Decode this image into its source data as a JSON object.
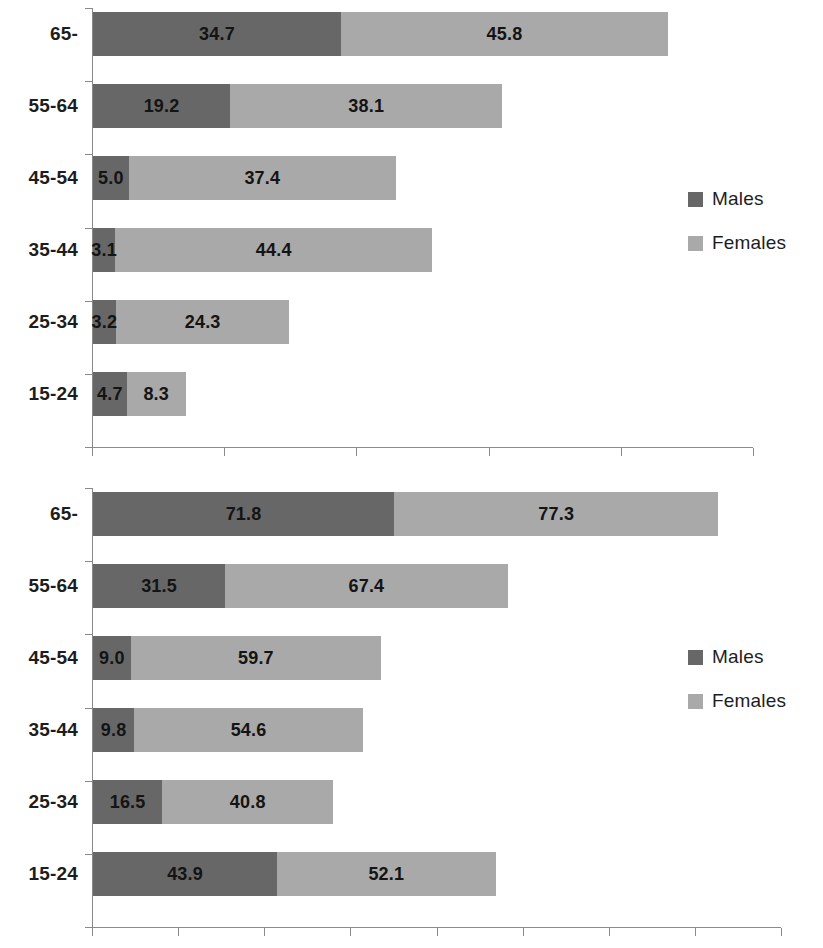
{
  "chart_data": [
    {
      "id": "top",
      "type": "bar",
      "orientation": "horizontal",
      "stacked": true,
      "title": "",
      "subtitle": "",
      "xlabel": "",
      "ylabel": "",
      "grid": false,
      "legend_position": "right-middle",
      "categories": [
        "65-",
        "55-64",
        "45-54",
        "35-44",
        "25-34",
        "15-24"
      ],
      "series": [
        {
          "name": "Males",
          "color": "#676767",
          "values": [
            34.7,
            19.2,
            5.0,
            3.1,
            3.2,
            4.7
          ]
        },
        {
          "name": "Females",
          "color": "#a9a9a9",
          "values": [
            45.8,
            38.1,
            37.4,
            44.4,
            24.3,
            8.3
          ]
        }
      ],
      "value_labels": [
        [
          "34.7",
          "45.8"
        ],
        [
          "19.2",
          "38.1"
        ],
        [
          "5.0",
          "37.4"
        ],
        [
          "3.1",
          "44.4"
        ],
        [
          "3.2",
          "24.3"
        ],
        [
          "4.7",
          "8.3"
        ]
      ],
      "xlim": [
        0,
        90
      ],
      "x_tick_count": 6,
      "x_tick_labels": [
        "",
        "",
        "",
        "",
        "",
        ""
      ],
      "legend": [
        "Males",
        "Females"
      ]
    },
    {
      "id": "bottom",
      "type": "bar",
      "orientation": "horizontal",
      "stacked": true,
      "title": "",
      "subtitle": "",
      "xlabel": "",
      "ylabel": "",
      "grid": false,
      "legend_position": "right-middle",
      "categories": [
        "65-",
        "55-64",
        "45-54",
        "35-44",
        "25-34",
        "15-24"
      ],
      "series": [
        {
          "name": "Males",
          "color": "#676767",
          "values": [
            71.8,
            31.5,
            9.0,
            9.8,
            16.5,
            43.9
          ]
        },
        {
          "name": "Females",
          "color": "#a9a9a9",
          "values": [
            77.3,
            67.4,
            59.7,
            54.6,
            40.8,
            52.1
          ]
        }
      ],
      "value_labels": [
        [
          "71.8",
          "77.3"
        ],
        [
          "31.5",
          "67.4"
        ],
        [
          "9.0",
          "59.7"
        ],
        [
          "9.8",
          "54.6"
        ],
        [
          "16.5",
          "40.8"
        ],
        [
          "43.9",
          "52.1"
        ]
      ],
      "xlim": [
        0,
        160
      ],
      "x_tick_count": 9,
      "x_tick_labels": [
        "",
        "",
        "",
        "",
        "",
        "",
        "",
        "",
        ""
      ],
      "legend": [
        "Males",
        "Females"
      ]
    }
  ],
  "colors": {
    "males": "#676767",
    "females": "#a9a9a9",
    "axis": "#8a8a8a",
    "text": "#1a1a1a",
    "background": "#ffffff"
  },
  "legend_top": {
    "males_label": "Males",
    "females_label": "Females"
  },
  "legend_bottom": {
    "males_label": "Males",
    "females_label": "Females"
  }
}
